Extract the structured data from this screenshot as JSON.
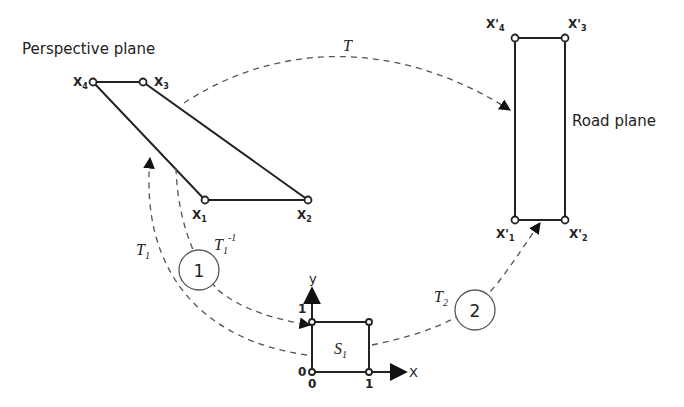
{
  "perspective_plane": {
    "label": "Perspective plane",
    "vertices": [
      {
        "id": "X1",
        "main": "X",
        "sub": "1"
      },
      {
        "id": "X2",
        "main": "X",
        "sub": "2"
      },
      {
        "id": "X3",
        "main": "X",
        "sub": "3"
      },
      {
        "id": "X4",
        "main": "X",
        "sub": "4"
      }
    ]
  },
  "road_plane": {
    "label": "Road plane",
    "vertices": [
      {
        "id": "X'1",
        "main": "X'",
        "sub": "1"
      },
      {
        "id": "X'2",
        "main": "X'",
        "sub": "2"
      },
      {
        "id": "X'3",
        "main": "X'",
        "sub": "3"
      },
      {
        "id": "X'4",
        "main": "X'",
        "sub": "4"
      }
    ]
  },
  "unit_square": {
    "label_main": "S",
    "label_sub": "1",
    "x_axis": "X",
    "y_axis": "y",
    "tick_x0": "0",
    "tick_x1": "1",
    "tick_y0": "0",
    "tick_y1": "1"
  },
  "transforms": {
    "T": {
      "main": "T"
    },
    "T1": {
      "main": "T",
      "sub": "1"
    },
    "T1_inv": {
      "main": "T",
      "sub": "1",
      "sup": "-1"
    },
    "T2": {
      "main": "T",
      "sub": "2"
    }
  },
  "steps": [
    {
      "number": "1"
    },
    {
      "number": "2"
    }
  ]
}
